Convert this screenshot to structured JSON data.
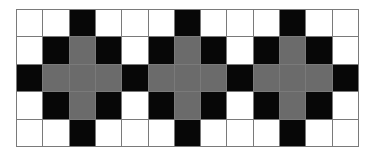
{
  "pattern": {
    "rows": 5,
    "cols": 13,
    "legend": {
      "W": "white",
      "B": "black",
      "G": "gray"
    },
    "colors": {
      "W": "#ffffff",
      "B": "#070707",
      "G": "#6b6b6b",
      "gridline": "#7a7a7a"
    },
    "cells": [
      [
        "W",
        "W",
        "B",
        "W",
        "W",
        "W",
        "B",
        "W",
        "W",
        "W",
        "B",
        "W",
        "W"
      ],
      [
        "W",
        "B",
        "G",
        "B",
        "W",
        "B",
        "G",
        "B",
        "W",
        "B",
        "G",
        "B",
        "W"
      ],
      [
        "B",
        "G",
        "G",
        "G",
        "B",
        "G",
        "G",
        "G",
        "B",
        "G",
        "G",
        "G",
        "B"
      ],
      [
        "W",
        "B",
        "G",
        "B",
        "W",
        "B",
        "G",
        "B",
        "W",
        "B",
        "G",
        "B",
        "W"
      ],
      [
        "W",
        "W",
        "B",
        "W",
        "W",
        "W",
        "B",
        "W",
        "W",
        "W",
        "B",
        "W",
        "W"
      ]
    ]
  }
}
